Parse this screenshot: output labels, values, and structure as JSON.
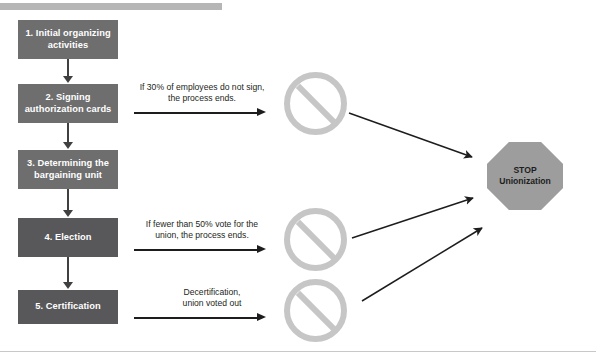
{
  "diagram": {
    "title_bar_color": "#b6b6b6",
    "box_color_light": "#6e6e6e",
    "box_color_dark": "#58585a",
    "nosign_color": "#c6c6c6",
    "stop_fill": "#9d9d9d",
    "stop_stroke": "#ffffff",
    "arrow_color": "#1d1d1d",
    "connector_color": "#404040",
    "steps": [
      {
        "label": "1. Initial organizing activities",
        "shade": "light"
      },
      {
        "label": "2. Signing authorization cards",
        "shade": "light"
      },
      {
        "label": "3. Determining the bargaining unit",
        "shade": "light"
      },
      {
        "label": "4. Election",
        "shade": "dark"
      },
      {
        "label": "5. Certification",
        "shade": "dark"
      }
    ],
    "branches": [
      {
        "line1": "If 30% of employees do not sign,",
        "line2": "the process ends.",
        "from_step": "2. Signing authorization cards"
      },
      {
        "line1": "If fewer than 50% vote for the",
        "line2": "union, the process ends.",
        "from_step": "4. Election"
      },
      {
        "line1": "Decertification,",
        "line2": "union voted out",
        "from_step": "5. Certification"
      }
    ],
    "terminators": [
      {
        "name": "prohibition-sign-1"
      },
      {
        "name": "prohibition-sign-2"
      },
      {
        "name": "prohibition-sign-3"
      }
    ],
    "outcome": {
      "line1": "STOP",
      "line2": "Unionization"
    }
  }
}
